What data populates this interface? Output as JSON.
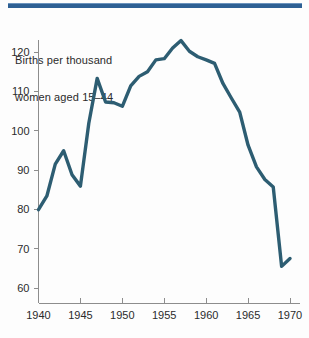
{
  "figure": {
    "title_line1": "Births per thousand",
    "title_line2": "women aged 15–44",
    "rule_color": "#2e6094",
    "line_color": "#2d5d72",
    "axis_color": "#8d8d8d",
    "background_color": "#fdfdfd",
    "text_color": "#2b2b2b"
  },
  "chart_data": {
    "type": "line",
    "title": "Births per thousand women aged 15–44",
    "subtitle": "",
    "xlabel": "",
    "ylabel": "Births per thousand women aged 15–44",
    "xlim": [
      1940,
      1971
    ],
    "ylim": [
      57,
      125
    ],
    "grid": false,
    "legend": false,
    "legend_position": "none",
    "x_tick_labels": [
      "1940",
      "1945",
      "1950",
      "1955",
      "1960",
      "1965",
      "1970"
    ],
    "x_ticks": [
      1940,
      1945,
      1950,
      1955,
      1960,
      1965,
      1970
    ],
    "y_tick_labels": [
      "60",
      "70",
      "80",
      "90",
      "100",
      "110",
      "120"
    ],
    "y_ticks": [
      60,
      70,
      80,
      90,
      100,
      110,
      120
    ],
    "series": [
      {
        "name": "Births per thousand women aged 15–44",
        "color": "#2d5d72",
        "x": [
          1940,
          1941,
          1942,
          1943,
          1944,
          1945,
          1946,
          1947,
          1948,
          1949,
          1950,
          1951,
          1952,
          1953,
          1954,
          1955,
          1956,
          1957,
          1958,
          1959,
          1960,
          1961,
          1962,
          1963,
          1964,
          1965,
          1966,
          1967,
          1968,
          1969,
          1970
        ],
        "values": [
          79.9,
          83.4,
          91.5,
          94.9,
          88.8,
          85.9,
          101.9,
          113.3,
          107.3,
          107.1,
          106.2,
          111.4,
          113.8,
          115.0,
          118.0,
          118.3,
          121.0,
          122.9,
          120.2,
          118.8,
          118.0,
          117.1,
          112.0,
          108.3,
          104.7,
          96.3,
          90.8,
          87.6,
          85.7,
          65.5,
          67.5
        ]
      }
    ]
  }
}
